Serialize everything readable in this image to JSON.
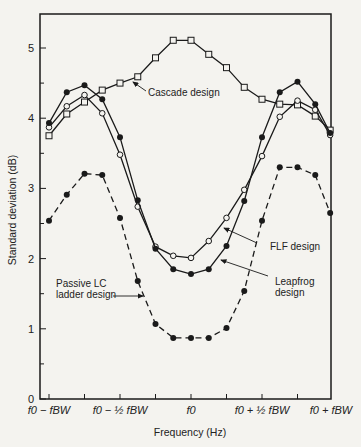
{
  "chart_data": {
    "type": "line",
    "title": "",
    "xlabel": "Frequency (Hz)",
    "ylabel": "Standard deviation (dB)",
    "ylim": [
      0,
      5.5
    ],
    "grid": false,
    "x_unit": "offset from f0 in units of f_BW",
    "x": [
      -1,
      -0.875,
      -0.75,
      -0.625,
      -0.5,
      -0.375,
      -0.25,
      -0.125,
      0,
      0.125,
      0.25,
      0.375,
      0.5,
      0.625,
      0.75,
      0.875,
      0.98
    ],
    "x_ticks": [
      {
        "value": -1,
        "label": "f0 − fBW"
      },
      {
        "value": -0.75,
        "label": ""
      },
      {
        "value": -0.5,
        "label": "f0 − ½ fBW"
      },
      {
        "value": -0.25,
        "label": ""
      },
      {
        "value": 0,
        "label": "f0"
      },
      {
        "value": 0.25,
        "label": ""
      },
      {
        "value": 0.5,
        "label": "f0 + ½ fBW"
      },
      {
        "value": 0.75,
        "label": ""
      },
      {
        "value": 1,
        "label": "f0 + fBW"
      }
    ],
    "y_ticks": [
      {
        "value": 0,
        "label": "0"
      },
      {
        "value": 0.5,
        "label": ""
      },
      {
        "value": 1,
        "label": "1"
      },
      {
        "value": 1.5,
        "label": ""
      },
      {
        "value": 2,
        "label": "2"
      },
      {
        "value": 2.5,
        "label": ""
      },
      {
        "value": 3,
        "label": "3"
      },
      {
        "value": 3.5,
        "label": ""
      },
      {
        "value": 4,
        "label": "4"
      },
      {
        "value": 4.5,
        "label": ""
      },
      {
        "value": 5,
        "label": "5"
      }
    ],
    "series": [
      {
        "name": "Cascade design",
        "marker": "open-square",
        "line": "solid",
        "values": [
          3.75,
          4.06,
          4.23,
          4.4,
          4.5,
          4.59,
          4.86,
          5.11,
          5.11,
          4.91,
          4.72,
          4.44,
          4.27,
          4.2,
          4.19,
          4.03,
          3.83
        ]
      },
      {
        "name": "FLF design",
        "marker": "open-circle",
        "line": "solid",
        "values": [
          3.87,
          4.17,
          4.33,
          4.07,
          3.48,
          2.74,
          2.17,
          2.04,
          2.01,
          2.25,
          2.58,
          2.98,
          3.46,
          4.02,
          4.25,
          4.12,
          3.76
        ]
      },
      {
        "name": "Leapfrog design",
        "marker": "filled-circle",
        "line": "solid",
        "values": [
          3.93,
          4.37,
          4.47,
          4.27,
          3.73,
          2.83,
          2.14,
          1.85,
          1.78,
          1.85,
          2.18,
          2.82,
          3.73,
          4.37,
          4.52,
          4.2,
          3.79
        ]
      },
      {
        "name": "Passive LC ladder design",
        "marker": "filled-circle",
        "line": "dashed",
        "values": [
          2.54,
          2.91,
          3.21,
          3.19,
          2.58,
          1.68,
          1.07,
          0.87,
          0.87,
          0.87,
          1.01,
          1.54,
          2.54,
          3.3,
          3.3,
          3.19,
          2.65
        ]
      }
    ],
    "annotations": [
      {
        "id": "cascade",
        "lines": [
          "Cascade design"
        ],
        "text_x": 148,
        "text_y": 96,
        "arrow_from": [
          146,
          91
        ],
        "arrow_to": [
          133,
          82
        ]
      },
      {
        "id": "flf",
        "lines": [
          "FLF design"
        ],
        "text_x": 270,
        "text_y": 250,
        "arrow_from": [
          257,
          243
        ],
        "arrow_to": [
          224,
          228
        ]
      },
      {
        "id": "leapfrog",
        "lines": [
          "Leapfrog",
          "design"
        ],
        "text_x": 275,
        "text_y": 285,
        "arrow_from": [
          268,
          276
        ],
        "arrow_to": [
          221,
          260
        ]
      },
      {
        "id": "passive",
        "lines": [
          "Passive LC",
          "ladder design"
        ],
        "text_x": 56,
        "text_y": 287,
        "arrow_from": [
          113,
          296
        ],
        "arrow_to": [
          143,
          296
        ]
      }
    ]
  }
}
